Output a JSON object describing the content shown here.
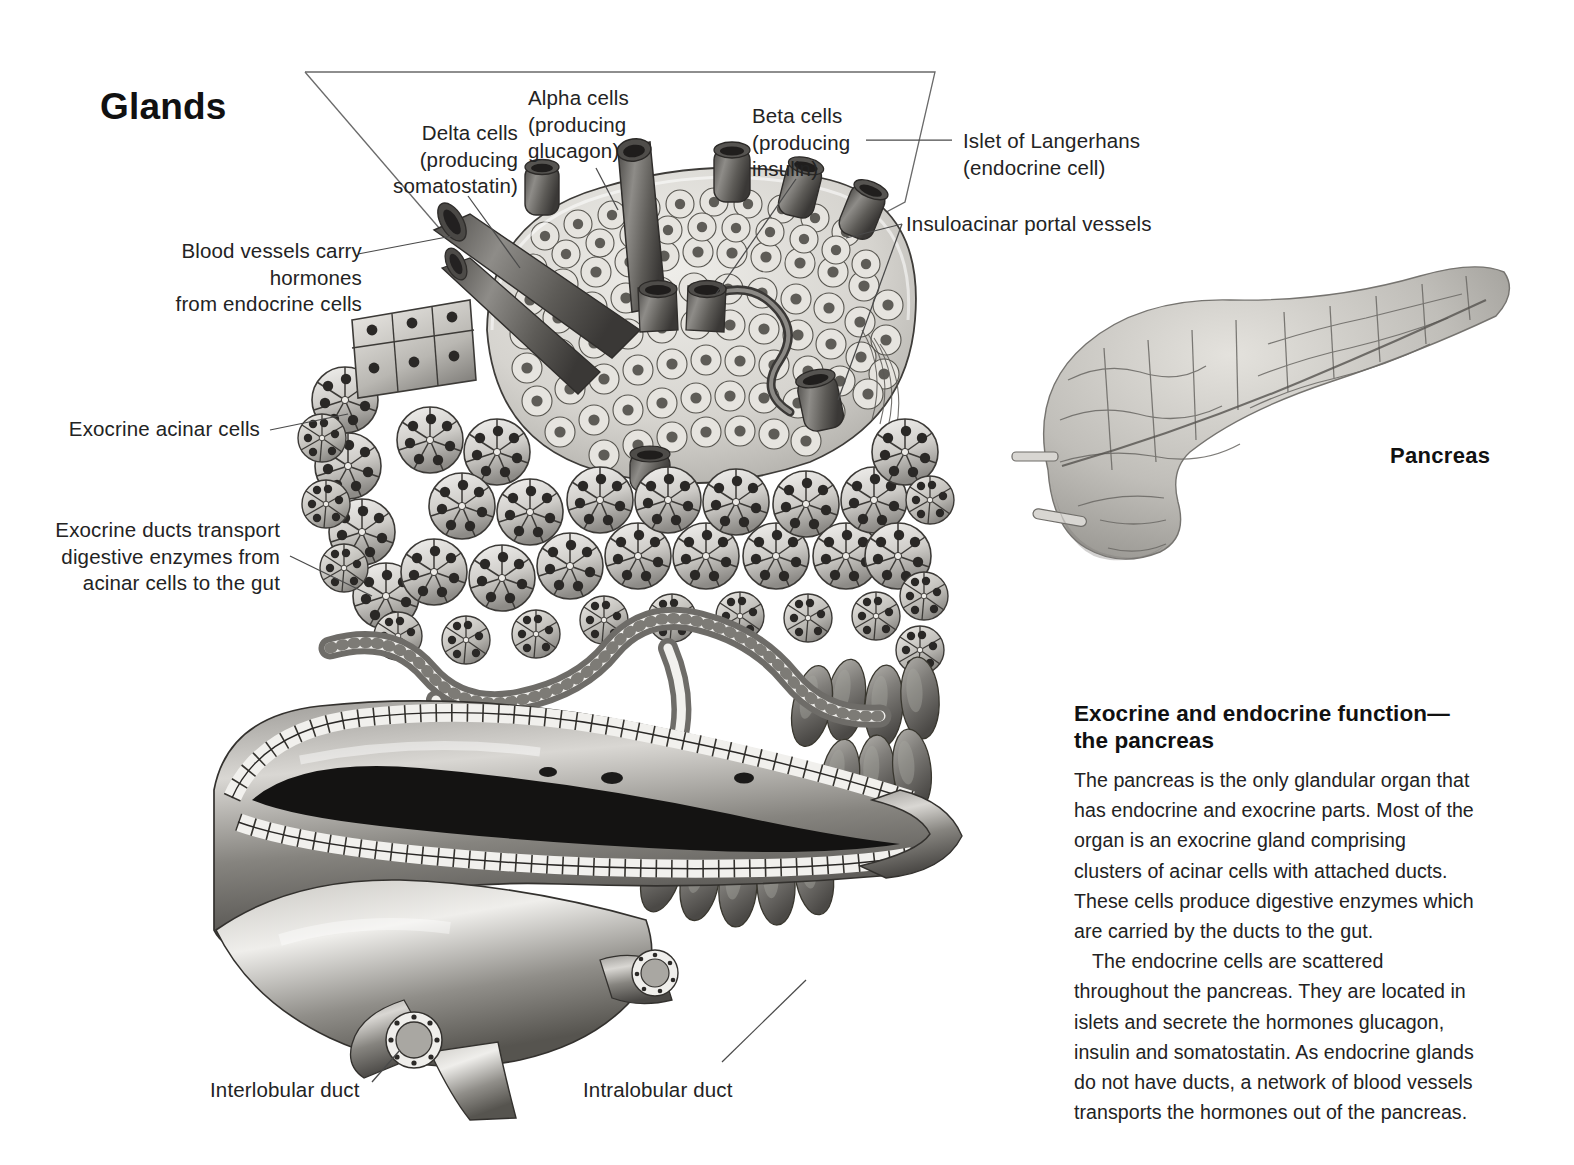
{
  "page": {
    "title": "Glands",
    "background_color": "#ffffff",
    "text_color": "#232323"
  },
  "organ_label": "Pancreas",
  "callouts": [
    {
      "id": "delta-cells",
      "text": "Delta cells\n(producing\nsomatostatin)"
    },
    {
      "id": "alpha-cells",
      "text": "Alpha cells\n(producing\nglucagon)"
    },
    {
      "id": "beta-cells",
      "text": "Beta cells\n(producing\ninsulin)"
    },
    {
      "id": "islet-of-langerhans",
      "text": "Islet of Langerhans\n(endocrine cell)"
    },
    {
      "id": "insuloacinar-portal-vessels",
      "text": "Insuloacinar portal vessels"
    },
    {
      "id": "blood-vessels",
      "text": "Blood vessels carry hormones\nfrom endocrine cells"
    },
    {
      "id": "exocrine-acinar-cells",
      "text": "Exocrine acinar cells"
    },
    {
      "id": "exocrine-ducts",
      "text": "Exocrine ducts transport\ndigestive enzymes from\nacinar cells to the gut"
    },
    {
      "id": "interlobular-duct",
      "text": "Interlobular duct"
    },
    {
      "id": "intralobular-duct",
      "text": "Intralobular duct"
    }
  ],
  "article": {
    "heading": "Exocrine and endocrine function—the pancreas",
    "paragraphs": [
      "The pancreas is the only glandular organ that has endocrine and exocrine parts. Most of the organ is an exocrine gland comprising clusters of acinar cells with attached ducts. These cells produce digestive enzymes which are carried by the ducts to the gut.",
      "The endocrine cells are scattered throughout the pancreas. They are located in islets and secrete the hormones glucagon, insulin and somatostatin. As endocrine glands do not have ducts, a network of blood vessels transports the hormones out of the pancreas."
    ]
  },
  "illustration": {
    "name": "pancreas-acinus-and-islet-cutaway",
    "description": "Grayscale anatomical illustration of pancreatic acinar cell clusters surrounding an islet of Langerhans, with blood vessels and a cut-open interlobular duct below.",
    "organ_inset": "pancreas-whole-organ"
  }
}
